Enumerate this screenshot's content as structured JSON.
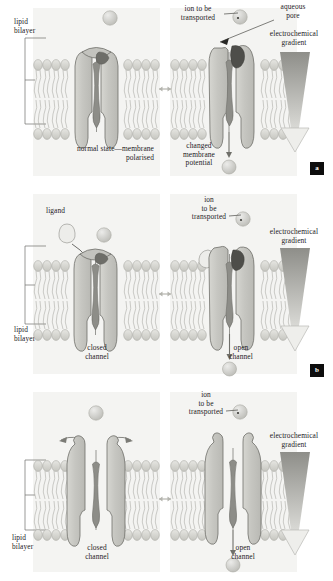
{
  "figure": {
    "colors": {
      "panel_background": "#f4f4f2",
      "protein_fill": "#c9c9c4",
      "protein_stroke": "#6f6f6a",
      "pore_dark": "#6b6b66",
      "lipid_head": "#d8d8d3",
      "lipid_stroke": "#a6a6a0",
      "ion_fill": "#cdcdc8",
      "gradient_dark": "#8e8e89",
      "gradient_light": "#e4e4e0",
      "badge_background": "#0d0d0d",
      "text": "#24201e"
    }
  },
  "panels": [
    {
      "id": "a",
      "badge": "a",
      "labels": {
        "lipid_bilayer": "lipid\nbilayer",
        "ion_to_be_transported": "ion to be\ntransported",
        "aqueous_pore": "aqueous\npore",
        "electrochemical_gradient": "electrochemical\ngradient",
        "left_caption": "normal state—membrane\npolarised",
        "right_caption": "changed\nmembrane\npotential"
      }
    },
    {
      "id": "b",
      "badge": "b",
      "labels": {
        "ligand": "ligand",
        "lipid_bilayer": "lipid\nbilayer",
        "ion_to_be_transported": "ion\nto be\ntransported",
        "electrochemical_gradient": "electrochemical\ngradient",
        "left_caption": "closed\nchannel",
        "right_caption": "open\nchannel"
      }
    },
    {
      "id": "c",
      "badge": "c",
      "labels": {
        "lipid_bilayer": "lipid\nbilayer",
        "ion_to_be_transported": "ion\nto be\ntransported",
        "electrochemical_gradient": "electrochemical\ngradient",
        "left_caption": "closed\nchannel",
        "right_caption": "open\nchannel"
      }
    }
  ]
}
